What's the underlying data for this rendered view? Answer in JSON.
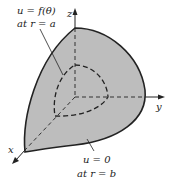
{
  "diagram": {
    "type": "spherical-shell-octant",
    "colors": {
      "shell_fill": "#bdbdbd",
      "stroke": "#222222",
      "background": "#ffffff"
    },
    "axes": {
      "x": {
        "label": "x"
      },
      "y": {
        "label": "y"
      },
      "z": {
        "label": "z"
      }
    },
    "annotations": {
      "inner": {
        "line1": "u = f(θ)",
        "line2": "at r = a"
      },
      "outer": {
        "line1": "u = 0",
        "line2": "at r = b"
      }
    }
  }
}
